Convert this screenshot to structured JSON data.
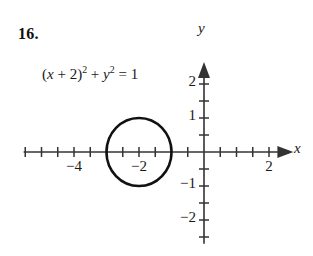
{
  "problem": {
    "number": "16.",
    "equation_text": "(x + 2)^2 + y^2 = 1",
    "equation_parts": {
      "open_paren": "(",
      "var_x": "x",
      "plus_one": " + ",
      "const_two": "2",
      "close_paren": ")",
      "exp_a": "2",
      "plus_two": " + ",
      "var_y": "y",
      "exp_b": "2",
      "equals": " = ",
      "rhs": "1"
    }
  },
  "chart_data": {
    "type": "scatter",
    "title": "",
    "xlabel": "x",
    "ylabel": "y",
    "grid": false,
    "legend": "none",
    "xlim": [
      -5.55,
      2.75
    ],
    "ylim": [
      -2.7,
      2.65
    ],
    "x_major_ticks": [
      -4,
      2
    ],
    "x_major_tick_labels": [
      "−4",
      "2"
    ],
    "x_minor_tick_step": 0.5,
    "y_major_ticks": [
      2,
      1,
      -1,
      -2
    ],
    "y_major_tick_labels": [
      "2",
      "1",
      "−1",
      "−2"
    ],
    "y_minor_tick_step": 0.5,
    "extra_x_labels": [
      {
        "value": -2,
        "text": "−2"
      }
    ],
    "shapes": [
      {
        "kind": "circle",
        "equation": "(x + 2)^2 + y^2 = 1",
        "center_x": -2,
        "center_y": 0,
        "radius": 1,
        "stroke": "#111111",
        "fill": "none"
      }
    ],
    "axis_arrows": {
      "x_positive": true,
      "y_positive": true
    },
    "colors": {
      "axis": "#333333",
      "curve": "#111111",
      "background": "#ffffff",
      "text": "#1a1a1a"
    }
  }
}
